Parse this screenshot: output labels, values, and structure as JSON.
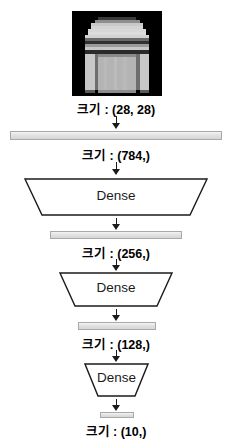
{
  "diagram": {
    "input_image": {
      "icon": "fashion-mnist-pullover-thumbnail",
      "alt": "grayscale 28x28 clothing image",
      "background_color": "#000000"
    },
    "stages": [
      {
        "id": "input",
        "shape_label": "ㅏㄱㅣ : (28, 28)"
      },
      {
        "id": "flatten",
        "shape_label": "크기 : (784,)"
      },
      {
        "id": "dense1",
        "shape_label": "크기 : (256,)"
      },
      {
        "id": "dense2",
        "shape_label": "크기 : (128,)"
      },
      {
        "id": "dense3",
        "shape_label": "크기 : (10,)"
      }
    ],
    "captions": [
      "크기 : (28, 28)",
      "크기 : (784,)",
      "크기 : (256,)",
      "크기 : (128,)",
      "크기 : (10,)"
    ],
    "layers": [
      {
        "name": "dense-layer-1",
        "label": "Dense"
      },
      {
        "name": "dense-layer-2",
        "label": "Dense"
      },
      {
        "name": "dense-layer-3",
        "label": "Dense"
      }
    ],
    "colors": {
      "bar_fill": "#e2e2e2",
      "bar_border": "#a9a9a9",
      "stroke": "#1b1b1b",
      "text": "#000000",
      "background": "#ffffff"
    }
  }
}
